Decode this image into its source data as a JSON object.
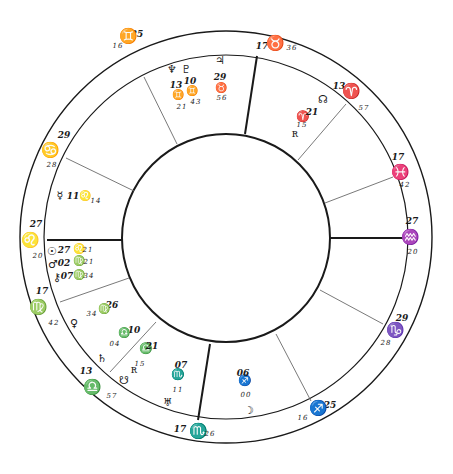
{
  "chart_data": {
    "type": "natal-chart-wheel",
    "center": [
      226,
      237
    ],
    "radii": {
      "outer": 206,
      "ring": 182,
      "inner": 104
    },
    "colors": {
      "ink": "#1a1a1a",
      "thin_line": "#6a6a6a",
      "background": "#ffffff"
    },
    "cusps": [
      {
        "id": "mc",
        "weight": "thick",
        "x1": 257,
        "y1": 56,
        "x2": 245,
        "y2": 134,
        "deg": "17",
        "sign": "♉",
        "sign_name": "taurus",
        "min": "36",
        "label_pos": [
          [
            262,
            49
          ],
          [
            275,
            48
          ],
          [
            292,
            50
          ]
        ]
      },
      {
        "id": "h11",
        "weight": "thin",
        "x1": 144,
        "y1": 77,
        "x2": 177,
        "y2": 144,
        "deg": "25",
        "sign": "♊",
        "sign_name": "gemini",
        "min": "16",
        "label_pos": [
          [
            137,
            37
          ],
          [
            128,
            41
          ],
          [
            118,
            48
          ]
        ]
      },
      {
        "id": "h12",
        "weight": "thin",
        "x1": 66,
        "y1": 158,
        "x2": 134,
        "y2": 191,
        "deg": "29",
        "sign": "♋",
        "sign_name": "cancer",
        "min": "28",
        "label_pos": [
          [
            64,
            138
          ],
          [
            50,
            155
          ],
          [
            52,
            167
          ]
        ]
      },
      {
        "id": "asc",
        "weight": "thick",
        "x1": 47,
        "y1": 240,
        "x2": 123,
        "y2": 240,
        "deg": "27",
        "sign": "♌",
        "sign_name": "leo",
        "min": "20",
        "label_pos": [
          [
            36,
            227
          ],
          [
            30,
            245
          ],
          [
            38,
            258
          ]
        ]
      },
      {
        "id": "h2",
        "weight": "thin",
        "x1": 60,
        "y1": 302,
        "x2": 129,
        "y2": 278,
        "deg": "17",
        "sign": "♍",
        "sign_name": "virgo",
        "min": "42",
        "label_pos": [
          [
            42,
            294
          ],
          [
            38,
            312
          ],
          [
            54,
            325
          ]
        ]
      },
      {
        "id": "h3",
        "weight": "thin",
        "x1": 110,
        "y1": 372,
        "x2": 156,
        "y2": 322,
        "deg": "13",
        "sign": "♎",
        "sign_name": "libra",
        "min": "57",
        "label_pos": [
          [
            86,
            374
          ],
          [
            92,
            392
          ],
          [
            112,
            398
          ]
        ]
      },
      {
        "id": "ic",
        "weight": "thick",
        "x1": 198,
        "y1": 420,
        "x2": 210,
        "y2": 344,
        "deg": "17",
        "sign": "♏",
        "sign_name": "scorpio",
        "min": "26",
        "label_pos": [
          [
            180,
            432
          ],
          [
            198,
            436
          ],
          [
            210,
            436
          ]
        ]
      },
      {
        "id": "h5",
        "weight": "thin",
        "x1": 311,
        "y1": 401,
        "x2": 276,
        "y2": 334,
        "deg": "25",
        "sign": "♐",
        "sign_name": "sagittarius",
        "min": "16",
        "label_pos": [
          [
            330,
            408
          ],
          [
            318,
            413
          ],
          [
            303,
            420
          ]
        ]
      },
      {
        "id": "h6",
        "weight": "thin",
        "x1": 383,
        "y1": 324,
        "x2": 320,
        "y2": 290,
        "deg": "29",
        "sign": "♑",
        "sign_name": "capricorn",
        "min": "28",
        "label_pos": [
          [
            402,
            321
          ],
          [
            395,
            335
          ],
          [
            386,
            345
          ]
        ]
      },
      {
        "id": "dsc",
        "weight": "thick",
        "x1": 405,
        "y1": 238,
        "x2": 330,
        "y2": 238,
        "deg": "27",
        "sign": "♒",
        "sign_name": "aquarius",
        "min": "20",
        "label_pos": [
          [
            412,
            224
          ],
          [
            410,
            242
          ],
          [
            413,
            254
          ]
        ]
      },
      {
        "id": "h8",
        "weight": "thin",
        "x1": 393,
        "y1": 177,
        "x2": 325,
        "y2": 203,
        "deg": "17",
        "sign": "♓",
        "sign_name": "pisces",
        "min": "42",
        "label_pos": [
          [
            398,
            160
          ],
          [
            400,
            177
          ],
          [
            405,
            187
          ]
        ]
      },
      {
        "id": "h9",
        "weight": "thin",
        "x1": 346,
        "y1": 104,
        "x2": 298,
        "y2": 160,
        "deg": "13",
        "sign": "♈",
        "sign_name": "aries",
        "min": "57",
        "label_pos": [
          [
            339,
            89
          ],
          [
            351,
            96
          ],
          [
            364,
            110
          ]
        ]
      }
    ],
    "planets": [
      {
        "name": "neptune",
        "glyph": "♆",
        "deg": "13",
        "sign": "♊",
        "min": "21",
        "layout": "stack",
        "glyph_pos": [
          172,
          73
        ],
        "deg_pos": [
          176,
          88
        ],
        "sign_pos": [
          178,
          98
        ],
        "min_pos": [
          182,
          109
        ]
      },
      {
        "name": "pluto",
        "glyph": "♇",
        "deg": "10",
        "sign": "♊",
        "min": "43",
        "layout": "stack",
        "glyph_pos": [
          186,
          73
        ],
        "deg_pos": [
          190,
          84
        ],
        "sign_pos": [
          192,
          94
        ],
        "min_pos": [
          196,
          104
        ]
      },
      {
        "name": "jupiter",
        "glyph": "♃",
        "deg": "29",
        "sign": "♉",
        "min": "56",
        "layout": "stack",
        "glyph_pos": [
          220,
          64
        ],
        "deg_pos": [
          220,
          80
        ],
        "sign_pos": [
          221,
          91
        ],
        "min_pos": [
          222,
          100
        ]
      },
      {
        "name": "north-node",
        "glyph": "☊",
        "deg": "",
        "sign": "",
        "min": "",
        "layout": "glyph",
        "glyph_pos": [
          323,
          103
        ]
      },
      {
        "name": "mars-asteroid-aries",
        "glyph": "♈",
        "deg": "21",
        "sign": "",
        "min": "15",
        "layout": "inline",
        "glyph_pos": [
          303,
          120
        ],
        "deg_pos": [
          312,
          115
        ],
        "min_pos": [
          302,
          127
        ]
      },
      {
        "name": "chiron-aries",
        "glyph": "ʀ",
        "deg": "",
        "sign": "",
        "min": "",
        "layout": "glyph",
        "glyph_pos": [
          295,
          137
        ]
      },
      {
        "name": "mercury",
        "glyph": "☿",
        "deg": "11",
        "sign": "♌",
        "min": "14",
        "layout": "row",
        "glyph_pos": [
          60,
          199
        ],
        "deg_pos": [
          73,
          199
        ],
        "sign_pos": [
          85,
          199
        ],
        "min_pos": [
          96,
          203
        ]
      },
      {
        "name": "sun",
        "glyph": "☉",
        "deg": "27",
        "sign": "♌",
        "min": "21",
        "layout": "row",
        "glyph_pos": [
          52,
          255
        ],
        "deg_pos": [
          64,
          253
        ],
        "sign_pos": [
          79,
          252
        ],
        "min_pos": [
          88,
          252
        ]
      },
      {
        "name": "mars",
        "glyph": "♂",
        "deg": "02",
        "sign": "♍",
        "min": "21",
        "layout": "row",
        "glyph_pos": [
          53,
          268
        ],
        "deg_pos": [
          64,
          266
        ],
        "sign_pos": [
          79,
          264
        ],
        "min_pos": [
          89,
          264
        ]
      },
      {
        "name": "chiron",
        "glyph": "⚷",
        "deg": "07",
        "sign": "♍",
        "min": "34",
        "layout": "row",
        "glyph_pos": [
          57,
          281
        ],
        "deg_pos": [
          67,
          279
        ],
        "sign_pos": [
          79,
          278
        ],
        "min_pos": [
          89,
          278
        ]
      },
      {
        "name": "venus",
        "glyph": "♀",
        "deg": "26",
        "sign": "♍",
        "min": "34",
        "layout": "row",
        "glyph_pos": [
          74,
          327
        ],
        "deg_pos": [
          112,
          308
        ],
        "sign_pos": [
          104,
          312
        ],
        "min_pos": [
          92,
          316
        ]
      },
      {
        "name": "saturn",
        "glyph": "♄",
        "deg": "10",
        "sign": "♎",
        "min": "04",
        "layout": "row",
        "glyph_pos": [
          102,
          362
        ],
        "deg_pos": [
          134,
          333
        ],
        "sign_pos": [
          124,
          336
        ],
        "min_pos": [
          115,
          346
        ]
      },
      {
        "name": "south-node",
        "glyph": "☋",
        "deg": "",
        "sign": "",
        "min": "",
        "layout": "glyph",
        "glyph_pos": [
          124,
          384
        ]
      },
      {
        "name": "asteroid-libra",
        "glyph": "♎",
        "deg": "21",
        "sign": "",
        "min": "15",
        "layout": "inline",
        "glyph_pos": [
          146,
          352
        ],
        "deg_pos": [
          152,
          349
        ],
        "min_pos": [
          140,
          366
        ]
      },
      {
        "name": "ceres-libra",
        "glyph": "ʀ",
        "deg": "",
        "sign": "",
        "min": "",
        "layout": "glyph",
        "glyph_pos": [
          134,
          373
        ]
      },
      {
        "name": "mercury-scorpio",
        "glyph": "♏",
        "deg": "07",
        "sign": "",
        "min": "11",
        "layout": "stack",
        "glyph_pos": [
          178,
          378
        ],
        "deg_pos": [
          181,
          368
        ],
        "min_pos": [
          178,
          392
        ]
      },
      {
        "name": "uranus",
        "glyph": "♅",
        "deg": "",
        "sign": "",
        "min": "",
        "layout": "glyph",
        "glyph_pos": [
          168,
          406
        ]
      },
      {
        "name": "moon-sag",
        "glyph": "♐",
        "deg": "06",
        "sign": "",
        "min": "00",
        "layout": "stack",
        "glyph_pos": [
          245,
          384
        ],
        "deg_pos": [
          243,
          376
        ],
        "min_pos": [
          246,
          397
        ]
      },
      {
        "name": "moon",
        "glyph": "☽",
        "deg": "",
        "sign": "",
        "min": "",
        "layout": "glyph",
        "glyph_pos": [
          249,
          414
        ]
      }
    ]
  }
}
